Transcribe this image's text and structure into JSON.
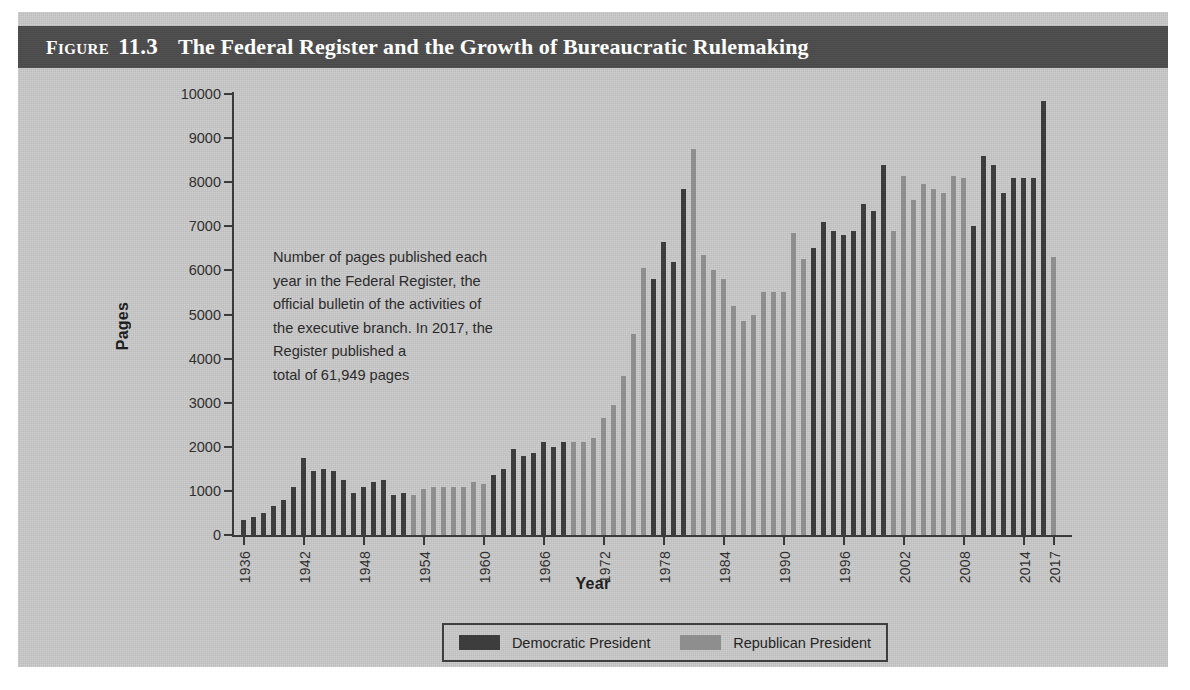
{
  "figure": {
    "label_prefix": "F",
    "label_rest": "IGURE",
    "number": "11.3",
    "title": "The Federal Register and the Growth of Bureaucratic Rulemaking"
  },
  "annotation": {
    "lines": [
      "Number of pages published each",
      "year in the Federal Register, the",
      "official bulletin of the activities of",
      "the executive branch. In 2017, the",
      "Register published a",
      "total of 61,949 pages"
    ]
  },
  "legend": {
    "items": [
      {
        "label": "Democratic President",
        "color": "#3d3d3d"
      },
      {
        "label": "Republican President",
        "color": "#8e8e8e"
      }
    ]
  },
  "colors": {
    "panel_background": "#c9c9c9",
    "title_bar": "#4d4d4d",
    "title_text": "#ffffff",
    "democratic": "#3d3d3d",
    "republican": "#8e8e8e",
    "axis": "#3a3a3a"
  },
  "chart_data": {
    "type": "bar",
    "title": "The Federal Register and the Growth of Bureaucratic Rulemaking",
    "xlabel": "Year",
    "ylabel": "Pages",
    "ylim": [
      0,
      10000
    ],
    "ytick_labels": [
      "0",
      "1000",
      "2000",
      "3000",
      "4000",
      "5000",
      "6000",
      "7000",
      "8000",
      "9000",
      "10000"
    ],
    "ytick_values": [
      0,
      1000,
      2000,
      3000,
      4000,
      5000,
      6000,
      7000,
      8000,
      9000,
      10000
    ],
    "xtick_labels": [
      "1936",
      "1942",
      "1948",
      "1954",
      "1960",
      "1966",
      "1972",
      "1978",
      "1984",
      "1990",
      "1996",
      "2002",
      "2008",
      "2014",
      "2017"
    ],
    "grid": false,
    "legend_position": "bottom",
    "series_key": "party",
    "categories": [
      1936,
      1937,
      1938,
      1939,
      1940,
      1941,
      1942,
      1943,
      1944,
      1945,
      1946,
      1947,
      1948,
      1949,
      1950,
      1951,
      1952,
      1953,
      1954,
      1955,
      1956,
      1957,
      1958,
      1959,
      1960,
      1961,
      1962,
      1963,
      1964,
      1965,
      1966,
      1967,
      1968,
      1969,
      1970,
      1971,
      1972,
      1973,
      1974,
      1975,
      1976,
      1977,
      1978,
      1979,
      1980,
      1981,
      1982,
      1983,
      1984,
      1985,
      1986,
      1987,
      1988,
      1989,
      1990,
      1991,
      1992,
      1993,
      1994,
      1995,
      1996,
      1997,
      1998,
      1999,
      2000,
      2001,
      2002,
      2003,
      2004,
      2005,
      2006,
      2007,
      2008,
      2009,
      2010,
      2011,
      2012,
      2013,
      2014,
      2015,
      2016,
      2017
    ],
    "values": [
      350,
      400,
      500,
      650,
      800,
      1100,
      1750,
      1450,
      1500,
      1450,
      1250,
      950,
      1100,
      1200,
      1250,
      900,
      950,
      900,
      1050,
      1100,
      1100,
      1100,
      1100,
      1200,
      1150,
      1350,
      1500,
      1950,
      1800,
      1850,
      2100,
      2000,
      2100,
      2100,
      2100,
      2200,
      2650,
      2950,
      3600,
      4550,
      6050,
      5800,
      6650,
      6200,
      7850,
      8750,
      6350,
      6000,
      5800,
      5200,
      4850,
      5000,
      5500,
      5500,
      5500,
      6850,
      6250,
      6500,
      7100,
      6900,
      6800,
      6900,
      7500,
      7350,
      8400,
      6900,
      8150,
      7600,
      7950,
      7850,
      7750,
      8150,
      8100,
      7000,
      8600,
      8400,
      7750,
      8100,
      8100,
      8100,
      9850,
      6300
    ],
    "party": [
      "Democratic",
      "Democratic",
      "Democratic",
      "Democratic",
      "Democratic",
      "Democratic",
      "Democratic",
      "Democratic",
      "Democratic",
      "Democratic",
      "Democratic",
      "Democratic",
      "Democratic",
      "Democratic",
      "Democratic",
      "Democratic",
      "Democratic",
      "Republican",
      "Republican",
      "Republican",
      "Republican",
      "Republican",
      "Republican",
      "Republican",
      "Republican",
      "Democratic",
      "Democratic",
      "Democratic",
      "Democratic",
      "Democratic",
      "Democratic",
      "Democratic",
      "Democratic",
      "Republican",
      "Republican",
      "Republican",
      "Republican",
      "Republican",
      "Republican",
      "Republican",
      "Republican",
      "Democratic",
      "Democratic",
      "Democratic",
      "Democratic",
      "Republican",
      "Republican",
      "Republican",
      "Republican",
      "Republican",
      "Republican",
      "Republican",
      "Republican",
      "Republican",
      "Republican",
      "Republican",
      "Republican",
      "Democratic",
      "Democratic",
      "Democratic",
      "Democratic",
      "Democratic",
      "Democratic",
      "Democratic",
      "Democratic",
      "Republican",
      "Republican",
      "Republican",
      "Republican",
      "Republican",
      "Republican",
      "Republican",
      "Republican",
      "Democratic",
      "Democratic",
      "Democratic",
      "Democratic",
      "Democratic",
      "Democratic",
      "Democratic",
      "Democratic",
      "Republican"
    ]
  }
}
